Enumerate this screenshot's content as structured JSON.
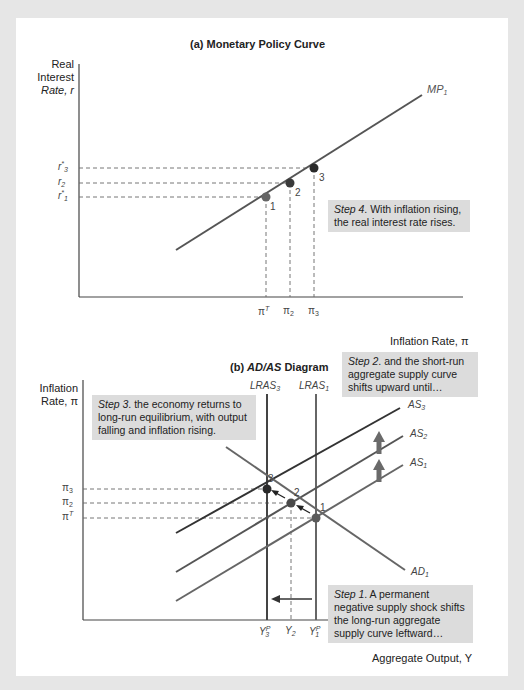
{
  "panel_a": {
    "title": "(a) Monetary Policy Curve",
    "y_axis_label": [
      "Real",
      "Interest",
      "Rate, r"
    ],
    "x_axis_label": "Inflation Rate, π",
    "curve_label": "MP",
    "curve_label_sub": "1",
    "y_ticks": [
      {
        "base": "r",
        "sup": "*",
        "sub": "3"
      },
      {
        "base": "r",
        "sup": "",
        "sub": "2"
      },
      {
        "base": "r",
        "sup": "*",
        "sub": "1"
      }
    ],
    "x_ticks": [
      {
        "base": "π",
        "sup": "T",
        "sub": ""
      },
      {
        "base": "π",
        "sup": "",
        "sub": "2"
      },
      {
        "base": "π",
        "sup": "",
        "sub": "3"
      }
    ],
    "point_labels": [
      "1",
      "2",
      "3"
    ],
    "step4": {
      "lead": "Step 4",
      "text": ". With inflation rising, the real interest rate rises."
    }
  },
  "panel_b": {
    "title_prefix": "(b) ",
    "title_italic": "AD/AS",
    "title_suffix": " Diagram",
    "y_axis_label": [
      "Inflation",
      "Rate, π"
    ],
    "x_axis_label": "Aggregate Output, Y",
    "curves": {
      "lras3": {
        "base": "LRAS",
        "sub": "3"
      },
      "lras1": {
        "base": "LRAS",
        "sub": "1"
      },
      "as3": {
        "base": "AS",
        "sub": "3"
      },
      "as2": {
        "base": "AS",
        "sub": "2"
      },
      "as1": {
        "base": "AS",
        "sub": "1"
      },
      "ad1": {
        "base": "AD",
        "sub": "1"
      }
    },
    "y_ticks": [
      {
        "base": "π",
        "sup": "",
        "sub": "3"
      },
      {
        "base": "π",
        "sup": "",
        "sub": "2"
      },
      {
        "base": "π",
        "sup": "T",
        "sub": ""
      }
    ],
    "x_ticks": [
      {
        "base": "Y",
        "sup": "P",
        "sub": "3"
      },
      {
        "base": "Y",
        "sup": "",
        "sub": "2"
      },
      {
        "base": "Y",
        "sup": "P",
        "sub": "1"
      }
    ],
    "point_labels": [
      "3",
      "2",
      "1"
    ],
    "step1": {
      "lead": "Step 1",
      "text": ". A permanent negative supply shock shifts the long-run aggregate supply curve leftward…"
    },
    "step2": {
      "lead": "Step 2",
      "text": ". and the short-run aggregate supply curve shifts upward until…"
    },
    "step3": {
      "lead": "Step 3",
      "text": ". the economy returns to long-run equilibrium, with output falling and inflation rising."
    }
  },
  "colors": {
    "background": "#e6e6e6",
    "panel": "#ffffff",
    "line": "#555555",
    "point": "#3a3a3a",
    "note_bg": "#dcdcdc",
    "arrow_up": "#6a6a6a"
  }
}
